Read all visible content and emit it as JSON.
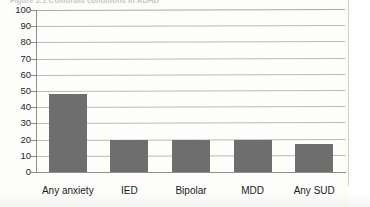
{
  "figure": {
    "caption": "Figure 2.1   Comorbid conditions in ADHD",
    "caption_truncated": true
  },
  "page": {
    "edge_visible": true
  },
  "chart_data": {
    "type": "bar",
    "title": "Figure 2.1   Comorbid conditions in ADHD",
    "categories": [
      "Any anxiety",
      "IED",
      "Bipolar",
      "MDD",
      "Any SUD"
    ],
    "values": [
      48,
      20,
      20,
      20,
      17
    ],
    "xlabel": "",
    "ylabel": "",
    "ylim": [
      0,
      100
    ],
    "yticks": [
      0,
      10,
      20,
      30,
      40,
      50,
      60,
      70,
      80,
      90,
      100
    ],
    "ytick_labels": [
      "0",
      "10",
      "20",
      "30",
      "40",
      "50",
      "60",
      "70",
      "80",
      "90",
      "100"
    ],
    "grid": true,
    "grid_axis": "y",
    "legend": false,
    "bar_color": "#6e6e6e",
    "grid_color": "#b9b9b9",
    "axis_color": "#8d8d8d"
  }
}
